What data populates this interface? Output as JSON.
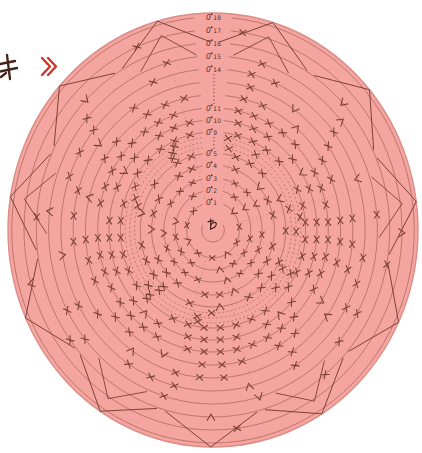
{
  "page": {
    "background": "#ffffff",
    "corner_fragment": {
      "clipped_text": "キ",
      "chevron": "》",
      "text_color": "#44231c",
      "chevron_color": "#d23527"
    }
  },
  "chart": {
    "type": "crochet-circular-chart",
    "center_label": "わ",
    "round_start_symbol": "0",
    "colors": {
      "disc": "#f4a59f",
      "disc_edge": "#dd8c86",
      "ring": "#b66e67",
      "symbol": "#7a3e35",
      "label": "#5b2a23",
      "center_text": "#402019"
    },
    "geometry": {
      "cx": 213,
      "cy": 230,
      "disc_rx": 205,
      "disc_ry": 217,
      "squash_x": 0.945,
      "center_ring_radius": 12
    },
    "rounds": [
      {
        "num": 1,
        "radius": 28,
        "kind": "solid",
        "labeled": true,
        "count": 11,
        "pattern": "xvxxvxxvx"
      },
      {
        "num": 2,
        "radius": 40,
        "kind": "solid",
        "labeled": true,
        "count": 16,
        "pattern": "xxv.x"
      },
      {
        "num": 3,
        "radius": 52,
        "kind": "solid",
        "labeled": true,
        "count": 21,
        "pattern": "xxxv.x"
      },
      {
        "num": 4,
        "radius": 65,
        "kind": "solid",
        "labeled": true,
        "count": 26,
        "pattern": "xx.vxx.x"
      },
      {
        "num": 5,
        "radius": 77,
        "kind": "solid",
        "labeled": true,
        "count": 30,
        "pattern": "xxxx.v.x."
      },
      {
        "num": 6,
        "radius": 83,
        "kind": "dotted",
        "labeled": false,
        "count": 17,
        "pattern": "x..x."
      },
      {
        "num": 7,
        "radius": 88,
        "kind": "dotted",
        "labeled": false,
        "count": 18,
        "pattern": ".x..x"
      },
      {
        "num": 8,
        "radius": 93,
        "kind": "dotted",
        "labeled": false,
        "count": 20,
        "pattern": "x...x."
      },
      {
        "num": 9,
        "radius": 98,
        "kind": "solid",
        "labeled": true,
        "count": 36,
        "pattern": "xxxxx.xx"
      },
      {
        "num": 10,
        "radius": 110,
        "kind": "solid",
        "labeled": true,
        "count": 40,
        "pattern": "xxxx.xvx."
      },
      {
        "num": 11,
        "radius": 122,
        "kind": "solid",
        "labeled": true,
        "count": 44,
        "pattern": "xxxxxx.xx"
      },
      {
        "num": 12,
        "radius": 135,
        "kind": "solid",
        "labeled": false,
        "count": 40,
        "pattern": "xxx.n.xx."
      },
      {
        "num": 13,
        "radius": 148,
        "kind": "solid",
        "labeled": false,
        "count": 36,
        "pattern": "xx.v.x..x"
      },
      {
        "num": 14,
        "radius": 161,
        "kind": "solid",
        "labeled": true,
        "count": 38,
        "pattern": "xxx..x.v.."
      },
      {
        "num": 15,
        "radius": 174,
        "kind": "solid",
        "labeled": true,
        "count": 32,
        "pattern": "xx..n..x.."
      },
      {
        "num": 16,
        "radius": 187,
        "kind": "solid",
        "labeled": true,
        "count": 27,
        "pattern": "x..v...x.."
      },
      {
        "num": 17,
        "radius": 200,
        "kind": "solid",
        "labeled": true,
        "count": 22,
        "pattern": "x....n...."
      },
      {
        "num": 18,
        "radius": 213,
        "kind": "solid",
        "labeled": true,
        "count": 0,
        "pattern": ""
      }
    ],
    "abbreviation_dot_bands": [
      {
        "from_radius": 81,
        "to_radius": 94
      },
      {
        "from_radius": 126,
        "to_radius": 157
      }
    ],
    "petals": {
      "count": 11,
      "base_radius": 188,
      "tip_radius": 217,
      "half_width_deg": 15,
      "echo_base_radius": 176,
      "echo_tip_radius": 202,
      "echo_half_width_deg": 10
    },
    "spokes": {
      "count": 12,
      "inner_radius": 32,
      "outer_radius": 158
    }
  }
}
